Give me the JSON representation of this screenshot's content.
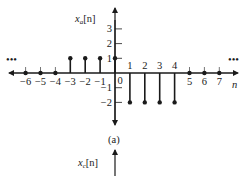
{
  "figure_a": {
    "ylabel_base": "x",
    "ylabel_sub": "a",
    "ylabel_arg": "[n]",
    "xlabel": "n",
    "caption": "(a)",
    "ellipsis_left": "•••",
    "ellipsis_right": "•••",
    "y_ticks": [
      {
        "value": 3,
        "label": "3"
      },
      {
        "value": 2,
        "label": "2"
      },
      {
        "value": 1,
        "label": "1"
      },
      {
        "value": -1,
        "label": "−1"
      },
      {
        "value": -2,
        "label": "−2"
      }
    ],
    "stems": [
      {
        "n": -6,
        "value": 0,
        "label": "−6"
      },
      {
        "n": -5,
        "value": 0,
        "label": "−5"
      },
      {
        "n": -4,
        "value": 0,
        "label": "−4"
      },
      {
        "n": -3,
        "value": 1,
        "label": "−3"
      },
      {
        "n": -2,
        "value": 1,
        "label": "−2"
      },
      {
        "n": -1,
        "value": 1,
        "label": "−1"
      },
      {
        "n": 0,
        "value": 1,
        "label": "0"
      },
      {
        "n": 1,
        "value": -2,
        "label": "1"
      },
      {
        "n": 2,
        "value": -2,
        "label": "2"
      },
      {
        "n": 3,
        "value": -2,
        "label": "3"
      },
      {
        "n": 4,
        "value": -2,
        "label": "4"
      },
      {
        "n": 5,
        "value": 0,
        "label": "5"
      },
      {
        "n": 6,
        "value": 0,
        "label": "6"
      },
      {
        "n": 7,
        "value": 0,
        "label": "7"
      }
    ]
  },
  "figure_c": {
    "ylabel_base": "x",
    "ylabel_sub": "c",
    "ylabel_arg": "[n]"
  }
}
